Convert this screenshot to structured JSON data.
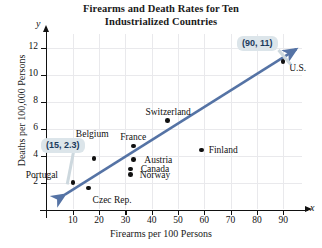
{
  "chart_data": {
    "type": "scatter",
    "title": "Firearms and Death Rates for Ten Industrialized Countries",
    "title_line1": "Firearms and Death Rates for Ten",
    "title_line2": "Industrialized Countries",
    "xlabel": "Firearms per 100 Persons",
    "ylabel": "Deaths per 100,000 Persons",
    "x_axis_letter": "x",
    "y_axis_letter": "y",
    "xlim": [
      0,
      97
    ],
    "ylim": [
      0,
      13
    ],
    "xticks": [
      10,
      20,
      30,
      40,
      50,
      60,
      70,
      80,
      90
    ],
    "yticks": [
      2,
      4,
      6,
      8,
      10,
      12
    ],
    "grid": true,
    "legend": "none",
    "points": [
      {
        "label": "Portugal",
        "x": 10,
        "y": 2.0,
        "label_pos": "left"
      },
      {
        "label": "Czec Rep.",
        "x": 16,
        "y": 1.6,
        "label_pos": "below-right"
      },
      {
        "label": "Belgium",
        "x": 18,
        "y": 3.8,
        "label_pos": "above"
      },
      {
        "label": "Norway",
        "x": 32,
        "y": 2.6,
        "label_pos": "right"
      },
      {
        "label": "Canada",
        "x": 32,
        "y": 3.0,
        "label_pos": "right"
      },
      {
        "label": "Austria",
        "x": 33,
        "y": 3.7,
        "label_pos": "right"
      },
      {
        "label": "France",
        "x": 33,
        "y": 4.7,
        "label_pos": "above"
      },
      {
        "label": "Switzerland",
        "x": 46,
        "y": 6.6,
        "label_pos": "above"
      },
      {
        "label": "Finland",
        "x": 59,
        "y": 4.4,
        "label_pos": "right"
      },
      {
        "label": "U.S.",
        "x": 90,
        "y": 11.0,
        "label_pos": "below-right"
      }
    ],
    "annotations": [
      {
        "text": "(15, 2.3)",
        "points_to": "Czec Rep."
      },
      {
        "text": "(90, 11)",
        "points_to": "U.S."
      }
    ],
    "trendline": {
      "description": "double-headed arrow line of best fit",
      "from": [
        7,
        1.1
      ],
      "to": [
        95,
        11.9
      ],
      "color": "#5573a5"
    }
  }
}
